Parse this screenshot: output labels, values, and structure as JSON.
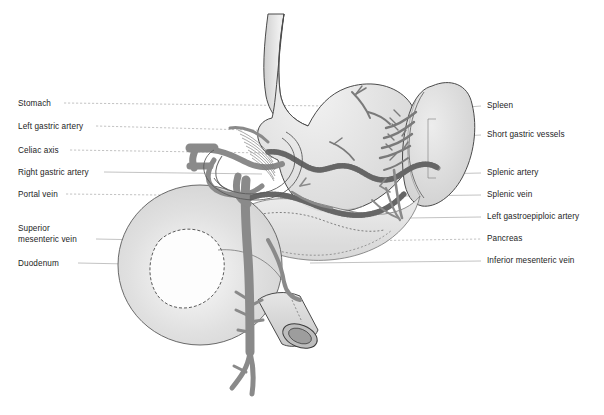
{
  "diagram": {
    "title_visible": false,
    "background": "#ffffff",
    "colors": {
      "outline": "#3a3a3a",
      "organ_fill_light": "#e9e9e9",
      "organ_fill_mid": "#d8d8d8",
      "vessel_gray": "#8e8e8e",
      "vessel_dark": "#6f6f6f",
      "leader_line": "#8a8a8a",
      "label_text": "#1d1d1d"
    }
  },
  "labels_left": [
    {
      "id": "stomach",
      "text": "Stomach",
      "x": 18,
      "y": 101,
      "leader_to_x": 330,
      "leader_to_y": 106,
      "dashed": true
    },
    {
      "id": "left-gastric-artery",
      "text": "Left gastric artery",
      "x": 18,
      "y": 124,
      "leader_to_x": 288,
      "leader_to_y": 130,
      "dashed": true
    },
    {
      "id": "celiac-axis",
      "text": "Celiac axis",
      "x": 18,
      "y": 148,
      "leader_to_x": 268,
      "leader_to_y": 152,
      "dashed": true
    },
    {
      "id": "right-gastric-artery",
      "text": "Right gastric artery",
      "x": 18,
      "y": 170,
      "leader_to_x": 262,
      "leader_to_y": 172,
      "dashed": false
    },
    {
      "id": "portal-vein",
      "text": "Portal vein",
      "x": 18,
      "y": 192,
      "leader_to_x": 253,
      "leader_to_y": 194,
      "dashed": true
    },
    {
      "id": "superior-mesenteric-vein",
      "text": "Superior",
      "x": 18,
      "y": 226,
      "leader_to_x": 0,
      "leader_to_y": 0,
      "dashed": false
    },
    {
      "id": "superior-mesenteric-vein-2",
      "text": "mesenteric vein",
      "x": 18,
      "y": 237,
      "leader_to_x": 252,
      "leader_to_y": 241,
      "dashed": false
    },
    {
      "id": "duodenum",
      "text": "Duodenum",
      "x": 18,
      "y": 261,
      "leader_to_x": 180,
      "leader_to_y": 264,
      "dashed": false
    }
  ],
  "labels_right": [
    {
      "id": "spleen",
      "text": "Spleen",
      "x": 487,
      "y": 104,
      "leader_to_x": 455,
      "leader_to_y": 108,
      "dashed": false
    },
    {
      "id": "short-gastric-vessels",
      "text": "Short gastric vessels",
      "x": 487,
      "y": 133,
      "leader_to_x": 440,
      "leader_to_y": 137,
      "dashed": false
    },
    {
      "id": "splenic-artery",
      "text": "Splenic artery",
      "x": 487,
      "y": 171,
      "leader_to_x": 437,
      "leader_to_y": 174,
      "dashed": false
    },
    {
      "id": "splenic-vein",
      "text": "Splenic vein",
      "x": 487,
      "y": 193,
      "leader_to_x": 403,
      "leader_to_y": 196,
      "dashed": false
    },
    {
      "id": "left-gastroepiploic-artery",
      "text": "Left gastroepiploic artery",
      "x": 487,
      "y": 215,
      "leader_to_x": 408,
      "leader_to_y": 218,
      "dashed": false
    },
    {
      "id": "pancreas",
      "text": "Pancreas",
      "x": 487,
      "y": 237,
      "leader_to_x": 350,
      "leader_to_y": 240,
      "dashed": true
    },
    {
      "id": "inferior-mesenteric-vein",
      "text": "Inferior mesenteric vein",
      "x": 487,
      "y": 259,
      "leader_to_x": 310,
      "leader_to_y": 262,
      "dashed": false
    }
  ],
  "structures": [
    {
      "id": "esophagus",
      "name": "esophagus"
    },
    {
      "id": "stomach-body",
      "name": "stomach"
    },
    {
      "id": "spleen-body",
      "name": "spleen"
    },
    {
      "id": "pancreas-body",
      "name": "pancreas"
    },
    {
      "id": "duodenum-loop",
      "name": "duodenum"
    },
    {
      "id": "splenic-vessels",
      "name": "splenic artery and vein"
    },
    {
      "id": "portal-venous-system",
      "name": "portal and superior mesenteric vein"
    },
    {
      "id": "celiac-trunk",
      "name": "celiac axis and branches"
    },
    {
      "id": "cut-bowel",
      "name": "transected bowel end"
    }
  ]
}
